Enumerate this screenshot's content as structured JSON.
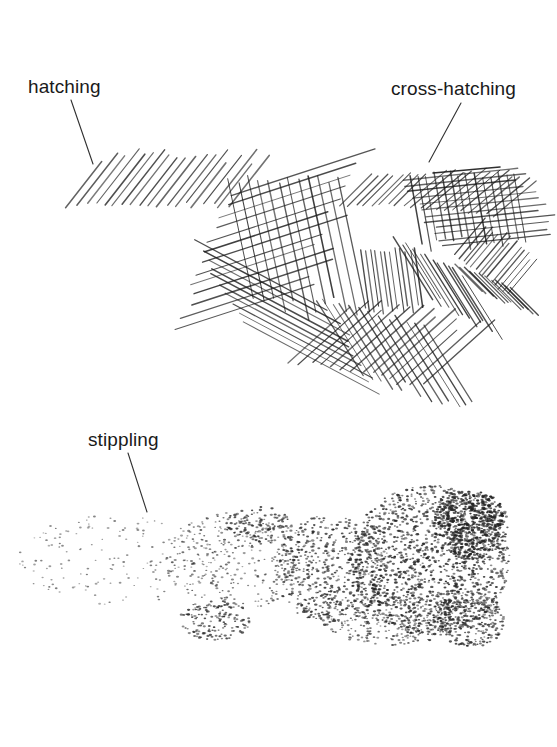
{
  "figure": {
    "background": "#ffffff",
    "ink_color": "#1a1a1a",
    "labels": [
      {
        "id": "hatching",
        "text": "hatching",
        "x": 28,
        "y": 77,
        "leader": {
          "x1": 71,
          "y1": 100,
          "x2": 93,
          "y2": 164
        }
      },
      {
        "id": "cross-hatching",
        "text": "cross-hatching",
        "x": 391,
        "y": 79,
        "leader": {
          "x1": 461,
          "y1": 103,
          "x2": 429,
          "y2": 162
        }
      },
      {
        "id": "stippling",
        "text": "stippling",
        "x": 88,
        "y": 430,
        "leader": {
          "x1": 128,
          "y1": 453,
          "x2": 147,
          "y2": 512
        }
      }
    ],
    "hatching": {
      "description": "parallel diagonal strokes, left region",
      "stroke_width": 1.3,
      "opacity": 0.75,
      "groups": [
        {
          "x0": 68,
          "y0": 205,
          "dx": 9,
          "dy": 0,
          "count": 19,
          "len": 62,
          "angle": -52,
          "jitter": 8
        }
      ]
    },
    "cross_hatching": {
      "description": "overlapping sets of strokes at different angles",
      "stroke_width": 1.2,
      "opacity": 0.8,
      "groups": [
        {
          "x0": 228,
          "y0": 178,
          "dx": 10,
          "dy": 0,
          "count": 12,
          "len": 130,
          "angle": 78,
          "jitter": 10
        },
        {
          "x0": 180,
          "y0": 328,
          "dx": 4,
          "dy": -11,
          "count": 13,
          "len": 140,
          "angle": -18,
          "jitter": 12
        },
        {
          "x0": 195,
          "y0": 240,
          "dx": 5,
          "dy": 9,
          "count": 10,
          "len": 150,
          "angle": 28,
          "jitter": 10
        },
        {
          "x0": 290,
          "y0": 360,
          "dx": 10,
          "dy": 2,
          "count": 14,
          "len": 90,
          "angle": -42,
          "jitter": 10
        },
        {
          "x0": 315,
          "y0": 300,
          "dx": 9,
          "dy": 2,
          "count": 13,
          "len": 95,
          "angle": 58,
          "jitter": 8
        },
        {
          "x0": 340,
          "y0": 205,
          "dx": 8,
          "dy": 0,
          "count": 8,
          "len": 45,
          "angle": -45,
          "jitter": 5
        },
        {
          "x0": 400,
          "y0": 180,
          "dx": 4,
          "dy": 6,
          "count": 12,
          "len": 115,
          "angle": -6,
          "jitter": 8
        },
        {
          "x0": 410,
          "y0": 175,
          "dx": 8,
          "dy": 0,
          "count": 14,
          "len": 70,
          "angle": 80,
          "jitter": 6
        },
        {
          "x0": 395,
          "y0": 240,
          "dx": 6,
          "dy": 3,
          "count": 12,
          "len": 70,
          "angle": 58,
          "jitter": 6
        },
        {
          "x0": 405,
          "y0": 205,
          "dx": 8,
          "dy": 1,
          "count": 12,
          "len": 60,
          "angle": -40,
          "jitter": 6
        },
        {
          "x0": 455,
          "y0": 255,
          "dx": 4,
          "dy": 3,
          "count": 14,
          "len": 45,
          "angle": -50,
          "jitter": 4
        },
        {
          "x0": 455,
          "y0": 265,
          "dx": 5,
          "dy": 2,
          "count": 12,
          "len": 40,
          "angle": 45,
          "jitter": 4
        },
        {
          "x0": 360,
          "y0": 250,
          "dx": 5,
          "dy": 0,
          "count": 12,
          "len": 60,
          "angle": 82,
          "jitter": 5
        }
      ],
      "top_strokes": [
        {
          "x1": 433,
          "y1": 173,
          "x2": 500,
          "y2": 167
        }
      ]
    },
    "stippling": {
      "description": "dot density increasing left to right",
      "seed": 7,
      "dot_color": "#222222",
      "regions": [
        {
          "cx": 115,
          "cy": 560,
          "rx": 100,
          "ry": 45,
          "count": 170,
          "r": 0.9,
          "opacity": 0.55
        },
        {
          "cx": 240,
          "cy": 560,
          "rx": 75,
          "ry": 50,
          "count": 320,
          "r": 1.0,
          "opacity": 0.65
        },
        {
          "cx": 260,
          "cy": 525,
          "rx": 35,
          "ry": 18,
          "count": 110,
          "r": 1.1,
          "opacity": 0.75
        },
        {
          "cx": 215,
          "cy": 620,
          "rx": 35,
          "ry": 20,
          "count": 150,
          "r": 1.1,
          "opacity": 0.75
        },
        {
          "cx": 330,
          "cy": 570,
          "rx": 55,
          "ry": 55,
          "count": 520,
          "r": 1.1,
          "opacity": 0.75
        },
        {
          "cx": 430,
          "cy": 560,
          "rx": 80,
          "ry": 75,
          "count": 1250,
          "r": 1.15,
          "opacity": 0.8
        },
        {
          "cx": 470,
          "cy": 525,
          "rx": 38,
          "ry": 35,
          "count": 550,
          "r": 1.2,
          "opacity": 0.85
        },
        {
          "cx": 470,
          "cy": 620,
          "rx": 35,
          "ry": 28,
          "count": 260,
          "r": 1.1,
          "opacity": 0.75
        },
        {
          "cx": 390,
          "cy": 620,
          "rx": 70,
          "ry": 25,
          "count": 300,
          "r": 1.0,
          "opacity": 0.7
        }
      ]
    }
  }
}
